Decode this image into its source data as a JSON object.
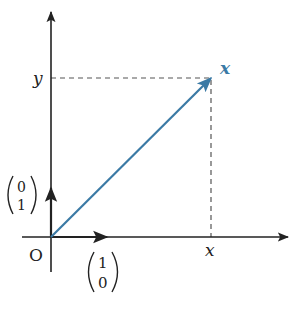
{
  "diagram": {
    "type": "vector-in-plane",
    "colors": {
      "axis": "#222222",
      "vector": "#3b7aa5",
      "dashed": "#555555",
      "text": "#222222",
      "vector_label": "#3b7aa5"
    },
    "labels": {
      "origin": "O",
      "y_axis_tick": "y",
      "x_axis_tick": "x",
      "vector": "x",
      "unit_x_top": "1",
      "unit_x_bottom": "0",
      "unit_y_top": "0",
      "unit_y_bottom": "1"
    },
    "elements": {
      "origin": [
        51,
        237
      ],
      "point": [
        211,
        78
      ],
      "unit_x_tip": [
        107,
        237
      ],
      "unit_y_tip": [
        51,
        188
      ]
    }
  }
}
